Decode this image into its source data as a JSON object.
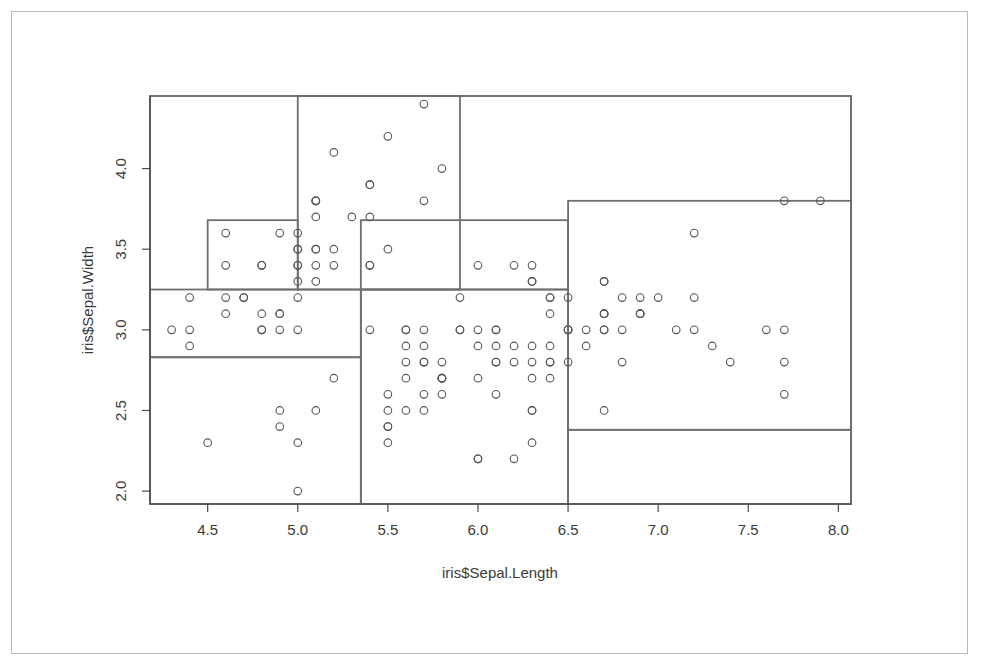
{
  "figure": {
    "kind": "scatterplot-with-partition-rectangles",
    "background_color": "#ffffff",
    "frame_color": "#b9b9b9",
    "plot_border_color": "#6f6f6f",
    "partition_color": "#6f6f6f",
    "point_color": "#555555",
    "axis_color": "#4a4a4a"
  },
  "axes": {
    "x_title": "iris$Sepal.Length",
    "y_title": "iris$Sepal.Width",
    "x_ticks": [
      "4.5",
      "5.0",
      "5.5",
      "6.0",
      "6.5",
      "7.0",
      "7.5",
      "8.0"
    ],
    "y_ticks": [
      "2.0",
      "2.5",
      "3.0",
      "3.5",
      "4.0"
    ]
  },
  "chart_data": {
    "type": "scatter",
    "title": "",
    "subtitle": "",
    "xlabel": "iris$Sepal.Length",
    "ylabel": "iris$Sepal.Width",
    "xlim": [
      4.18,
      8.07
    ],
    "ylim": [
      1.92,
      4.45
    ],
    "xticks": [
      4.5,
      5.0,
      5.5,
      6.0,
      6.5,
      7.0,
      7.5,
      8.0
    ],
    "yticks": [
      2.0,
      2.5,
      3.0,
      3.5,
      4.0
    ],
    "grid": false,
    "legend": "none",
    "marker": "open-circle",
    "marker_size": 5,
    "x": [
      5.1,
      4.9,
      4.7,
      4.6,
      5.0,
      5.4,
      4.6,
      5.0,
      4.4,
      4.9,
      5.4,
      4.8,
      4.8,
      4.3,
      5.8,
      5.7,
      5.4,
      5.1,
      5.7,
      5.1,
      5.4,
      5.1,
      4.6,
      5.1,
      4.8,
      5.0,
      5.0,
      5.2,
      5.2,
      4.7,
      4.8,
      5.4,
      5.2,
      5.5,
      4.9,
      5.0,
      5.5,
      4.9,
      4.4,
      5.1,
      5.0,
      4.5,
      4.4,
      5.0,
      5.1,
      4.8,
      5.1,
      4.6,
      5.3,
      5.0,
      7.0,
      6.4,
      6.9,
      5.5,
      6.5,
      5.7,
      6.3,
      4.9,
      6.6,
      5.2,
      5.0,
      5.9,
      6.0,
      6.1,
      5.6,
      6.7,
      5.6,
      5.8,
      6.2,
      5.6,
      5.9,
      6.1,
      6.3,
      6.1,
      6.4,
      6.6,
      6.8,
      6.7,
      6.0,
      5.7,
      5.5,
      5.5,
      5.8,
      6.0,
      5.4,
      6.0,
      6.7,
      6.3,
      5.6,
      5.5,
      5.5,
      6.1,
      5.8,
      5.0,
      5.6,
      5.7,
      5.7,
      6.2,
      5.1,
      5.7,
      6.3,
      5.8,
      7.1,
      6.3,
      6.5,
      7.6,
      4.9,
      7.3,
      6.7,
      7.2,
      6.5,
      6.4,
      6.8,
      5.7,
      5.8,
      6.4,
      6.5,
      7.7,
      7.7,
      6.0,
      6.9,
      5.6,
      7.7,
      6.3,
      6.7,
      7.2,
      6.2,
      6.1,
      6.4,
      7.2,
      7.4,
      7.9,
      6.4,
      6.3,
      6.1,
      7.7,
      6.3,
      6.4,
      6.0,
      6.9,
      6.7,
      6.9,
      5.8,
      6.8,
      6.7,
      6.7,
      6.3,
      6.5,
      6.2,
      5.9
    ],
    "y": [
      3.5,
      3.0,
      3.2,
      3.1,
      3.6,
      3.9,
      3.4,
      3.4,
      2.9,
      3.1,
      3.7,
      3.4,
      3.0,
      3.0,
      4.0,
      4.4,
      3.9,
      3.5,
      3.8,
      3.8,
      3.4,
      3.7,
      3.6,
      3.3,
      3.4,
      3.0,
      3.4,
      3.5,
      3.4,
      3.2,
      3.1,
      3.4,
      4.1,
      4.2,
      3.1,
      3.2,
      3.5,
      3.6,
      3.0,
      3.4,
      3.5,
      2.3,
      3.2,
      3.5,
      3.8,
      3.0,
      3.8,
      3.2,
      3.7,
      3.3,
      3.2,
      3.2,
      3.1,
      2.3,
      2.8,
      2.8,
      3.3,
      2.4,
      2.9,
      2.7,
      2.0,
      3.0,
      2.2,
      2.9,
      2.9,
      3.1,
      3.0,
      2.7,
      2.2,
      2.5,
      3.2,
      2.8,
      2.5,
      2.8,
      2.9,
      3.0,
      2.8,
      3.0,
      2.9,
      2.6,
      2.4,
      2.4,
      2.7,
      2.7,
      3.0,
      3.4,
      3.1,
      2.3,
      3.0,
      2.5,
      2.6,
      3.0,
      2.6,
      2.3,
      2.7,
      3.0,
      2.9,
      2.9,
      2.5,
      2.8,
      3.3,
      2.7,
      3.0,
      2.9,
      3.0,
      3.0,
      2.5,
      2.9,
      2.5,
      3.6,
      3.2,
      2.7,
      3.0,
      2.5,
      2.8,
      3.2,
      3.0,
      3.8,
      2.6,
      2.2,
      3.2,
      2.8,
      2.8,
      2.7,
      3.3,
      3.2,
      2.8,
      3.0,
      2.8,
      3.0,
      2.8,
      3.8,
      2.8,
      2.8,
      2.6,
      3.0,
      3.4,
      3.1,
      3.0,
      3.1,
      3.1,
      3.1,
      2.7,
      3.2,
      3.3,
      3.0,
      2.5,
      3.0,
      3.4,
      3.0
    ]
  },
  "partitions": [
    {
      "name": "region-low-length-mid-width",
      "x0": 4.18,
      "x1": 5.35,
      "y0": 2.83,
      "y1": 3.25
    },
    {
      "name": "region-low-length-low-width",
      "x0": 4.18,
      "x1": 5.35,
      "y0": 1.92,
      "y1": 2.83
    },
    {
      "name": "region-low-length-high-width",
      "x0": 4.5,
      "x1": 5.0,
      "y0": 3.25,
      "y1": 3.68
    },
    {
      "name": "region-mid-length-high-width",
      "x0": 5.0,
      "x1": 5.9,
      "y0": 3.25,
      "y1": 4.45
    },
    {
      "name": "region-mid-length-upper-band",
      "x0": 5.35,
      "x1": 6.5,
      "y0": 3.25,
      "y1": 3.68
    },
    {
      "name": "region-mid-length-low-width",
      "x0": 5.35,
      "x1": 6.5,
      "y0": 1.92,
      "y1": 3.25
    },
    {
      "name": "region-high-length-mid-width",
      "x0": 6.5,
      "x1": 8.07,
      "y0": 2.38,
      "y1": 3.8
    },
    {
      "name": "region-high-length-low-width",
      "x0": 6.5,
      "x1": 8.07,
      "y0": 1.92,
      "y1": 2.38
    },
    {
      "name": "region-plot-frame",
      "x0": 4.18,
      "x1": 8.07,
      "y0": 1.92,
      "y1": 4.45
    }
  ]
}
